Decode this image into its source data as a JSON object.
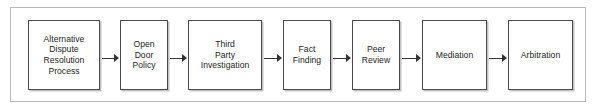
{
  "diagram": {
    "type": "horizontal-flowchart",
    "colors": {
      "background": "#ffffff",
      "outer_frame_border": "#b9b9b9",
      "node_border": "#4a4a4a",
      "node_fill": "#ffffff",
      "node_shadow": "#c2c2c2",
      "arrow": "#333333",
      "text": "#1d1d1d"
    },
    "nodes": [
      {
        "id": "adr-process",
        "label": "Alternative\nDispute\nResolution\nProcess",
        "x": 28,
        "width": 72
      },
      {
        "id": "open-door-policy",
        "label": "Open\nDoor\nPolicy",
        "x": 120,
        "width": 48
      },
      {
        "id": "third-party-investigation",
        "label": "Third\nParty\nInvestigation",
        "x": 188,
        "width": 74
      },
      {
        "id": "fact-finding",
        "label": "Fact\nFinding",
        "x": 283,
        "width": 48
      },
      {
        "id": "peer-review",
        "label": "Peer\nReview",
        "x": 352,
        "width": 48
      },
      {
        "id": "mediation",
        "label": "Mediation",
        "x": 422,
        "width": 65
      },
      {
        "id": "arbitration",
        "label": "Arbitration",
        "x": 508,
        "width": 65
      }
    ],
    "arrows": [
      {
        "id": "arrow-adr-to-open-door",
        "from": "adr-process",
        "to": "open-door-policy",
        "x": 102,
        "width": 17
      },
      {
        "id": "arrow-open-door-to-third-party",
        "from": "open-door-policy",
        "to": "third-party-investigation",
        "x": 170,
        "width": 17
      },
      {
        "id": "arrow-third-party-to-fact",
        "from": "third-party-investigation",
        "to": "fact-finding",
        "x": 264,
        "width": 18
      },
      {
        "id": "arrow-fact-to-peer",
        "from": "fact-finding",
        "to": "peer-review",
        "x": 333,
        "width": 18
      },
      {
        "id": "arrow-peer-to-mediation",
        "from": "peer-review",
        "to": "mediation",
        "x": 402,
        "width": 19
      },
      {
        "id": "arrow-mediation-to-arbitration",
        "from": "mediation",
        "to": "arbitration",
        "x": 489,
        "width": 18
      }
    ]
  }
}
